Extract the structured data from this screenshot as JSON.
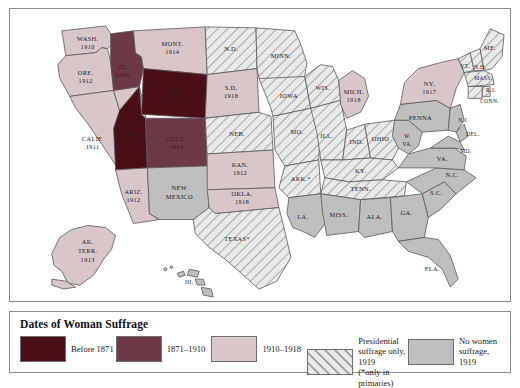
{
  "legend": {
    "title": "Dates of Woman Suffrage",
    "items": [
      {
        "label": "Before 1871",
        "color": "#4a0f16",
        "pattern": "solid"
      },
      {
        "label": "1871–1910",
        "color": "#6e3946",
        "pattern": "solid"
      },
      {
        "label": "1910–1918",
        "color": "#d8c6c9",
        "pattern": "solid"
      },
      {
        "label": "Presidential\nsuffrage only, 1919\n(*only in primaries)",
        "color": "#dcdcdc",
        "pattern": "hatched"
      },
      {
        "label": "No women\nsuffrage, 1919",
        "color": "#bebebe",
        "pattern": "solid"
      }
    ]
  },
  "map": {
    "states": [
      {
        "name": "WASH.",
        "date": "1910",
        "category": "1910-1918"
      },
      {
        "name": "ORE.",
        "date": "1912",
        "category": "1910-1918"
      },
      {
        "name": "CALIF.",
        "date": "1911",
        "category": "1910-1918"
      },
      {
        "name": "NEV.",
        "date": "1914",
        "category": "1910-1918"
      },
      {
        "name": "ID.",
        "date": "1896",
        "category": "1871-1910"
      },
      {
        "name": "MONT.",
        "date": "1914",
        "category": "1910-1918"
      },
      {
        "name": "WYO.",
        "date": "1869",
        "category": "before-1871"
      },
      {
        "name": "UTAH",
        "date": "1870",
        "category": "before-1871"
      },
      {
        "name": "COLO.",
        "date": "1893",
        "category": "1871-1910"
      },
      {
        "name": "ARIZ.",
        "date": "1912",
        "category": "1910-1918"
      },
      {
        "name": "NEW MEXICO",
        "date": "",
        "category": "no-suffrage"
      },
      {
        "name": "AK. TERR.",
        "date": "1913",
        "category": "1910-1918"
      },
      {
        "name": "N.D.",
        "date": "",
        "category": "presidential"
      },
      {
        "name": "S.D.",
        "date": "1918",
        "category": "1910-1918"
      },
      {
        "name": "NEB.",
        "date": "",
        "category": "presidential"
      },
      {
        "name": "KAN.",
        "date": "1912",
        "category": "1910-1918"
      },
      {
        "name": "OKLA.",
        "date": "1918",
        "category": "1910-1918"
      },
      {
        "name": "TEXAS*",
        "date": "",
        "category": "presidential"
      },
      {
        "name": "MINN.",
        "date": "",
        "category": "presidential"
      },
      {
        "name": "IOWA",
        "date": "",
        "category": "presidential"
      },
      {
        "name": "MO.",
        "date": "",
        "category": "presidential"
      },
      {
        "name": "ARK.*",
        "date": "",
        "category": "presidential"
      },
      {
        "name": "LA.",
        "date": "",
        "category": "no-suffrage"
      },
      {
        "name": "WIS.",
        "date": "",
        "category": "presidential"
      },
      {
        "name": "ILL.",
        "date": "",
        "category": "presidential"
      },
      {
        "name": "MICH.",
        "date": "1918",
        "category": "1910-1918"
      },
      {
        "name": "IND.",
        "date": "",
        "category": "presidential"
      },
      {
        "name": "OHIO",
        "date": "",
        "category": "presidential"
      },
      {
        "name": "KY.",
        "date": "",
        "category": "presidential"
      },
      {
        "name": "TENN.",
        "date": "",
        "category": "presidential"
      },
      {
        "name": "MISS.",
        "date": "",
        "category": "no-suffrage"
      },
      {
        "name": "ALA.",
        "date": "",
        "category": "no-suffrage"
      },
      {
        "name": "GA.",
        "date": "",
        "category": "no-suffrage"
      },
      {
        "name": "FLA.",
        "date": "",
        "category": "no-suffrage"
      },
      {
        "name": "S.C.",
        "date": "",
        "category": "no-suffrage"
      },
      {
        "name": "N.C.",
        "date": "",
        "category": "no-suffrage"
      },
      {
        "name": "VA.",
        "date": "",
        "category": "no-suffrage"
      },
      {
        "name": "W. VA.",
        "date": "",
        "category": "no-suffrage"
      },
      {
        "name": "PENNA",
        "date": "",
        "category": "no-suffrage"
      },
      {
        "name": "N.Y.",
        "date": "1917",
        "category": "1910-1918"
      },
      {
        "name": "VT.",
        "date": "",
        "category": "presidential"
      },
      {
        "name": "N.H.",
        "date": "",
        "category": "presidential"
      },
      {
        "name": "ME.",
        "date": "",
        "category": "presidential"
      },
      {
        "name": "MASS.",
        "date": "",
        "category": "presidential"
      },
      {
        "name": "R.I.",
        "date": "",
        "category": "presidential"
      },
      {
        "name": "CONN.",
        "date": "",
        "category": "presidential"
      },
      {
        "name": "N.J.",
        "date": "",
        "category": "no-suffrage"
      },
      {
        "name": "DEL.",
        "date": "",
        "category": "no-suffrage"
      },
      {
        "name": "MD.",
        "date": "",
        "category": "no-suffrage"
      },
      {
        "name": "HI.",
        "date": "",
        "category": "no-suffrage"
      }
    ],
    "labels": {
      "wash": "WASH.",
      "wash_d": "1910",
      "ore": "ORE.",
      "ore_d": "1912",
      "calif": "CALIF.",
      "calif_d": "1911",
      "nev": "NEV.",
      "nev_d": "1914",
      "id": "ID.",
      "id_d": "1896",
      "mont": "MONT.",
      "mont_d": "1914",
      "wyo": "WYO.",
      "wyo_d": "1869",
      "utah": "UTAH",
      "utah_d": "1870",
      "colo": "COLO.",
      "colo_d": "1893",
      "ariz": "ARIZ.",
      "ariz_d": "1912",
      "nm1": "NEW",
      "nm2": "MEXICO",
      "ak1": "AK.",
      "ak2": "TERR.",
      "ak3": "1913",
      "nd": "N.D.",
      "sd": "S.D.",
      "sd_d": "1918",
      "neb": "NEB.",
      "kan": "KAN.",
      "kan_d": "1912",
      "okla": "OKLA.",
      "okla_d": "1918",
      "texas": "TEXAS*",
      "minn": "MINN.",
      "iowa": "IOWA",
      "mo": "MO.",
      "ark": "ARK.*",
      "la": "LA.",
      "wis": "WIS.",
      "ill": "ILL.",
      "mich": "MICH.",
      "mich_d": "1918",
      "ind": "IND.",
      "ohio": "OHIO",
      "ky": "KY.",
      "tenn": "TENN.",
      "miss": "MISS.",
      "ala": "ALA.",
      "ga": "GA.",
      "fla": "FLA.",
      "sc": "S.C.",
      "nc": "N.C.",
      "va": "VA.",
      "wva1": "W.",
      "wva2": "VA.",
      "penna": "PENNA",
      "ny": "NY.",
      "ny_d": "1917",
      "vt": "VT.",
      "nh": "N.H.",
      "me": "ME.",
      "mass": "MASS.",
      "ri": "R.I.",
      "conn": "CONN.",
      "nj": "N.J.",
      "del": "DEL.",
      "md": "MD.",
      "hi": "HI."
    }
  }
}
